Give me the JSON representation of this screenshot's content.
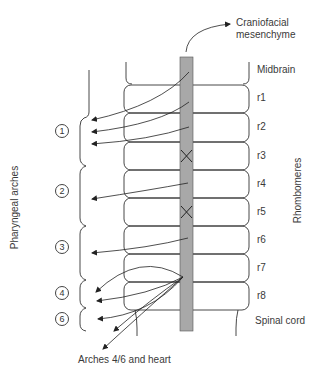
{
  "diagram": {
    "top_label": "Craniofacial\nmesenchyme",
    "top_label_line1": "Craniofacial",
    "top_label_line2": "mesenchyme",
    "bottom_label": "Arches 4/6 and heart",
    "left_axis_label": "Pharyngeal arches",
    "right_axis_label": "Rhombomeres",
    "segments": [
      {
        "label": "Midbrain",
        "y": 70
      },
      {
        "label": "r1",
        "y": 98
      },
      {
        "label": "r2",
        "y": 127
      },
      {
        "label": "r3",
        "y": 156
      },
      {
        "label": "r4",
        "y": 184
      },
      {
        "label": "r5",
        "y": 212
      },
      {
        "label": "r6",
        "y": 240
      },
      {
        "label": "r7",
        "y": 268
      },
      {
        "label": "r8",
        "y": 296
      },
      {
        "label": "Spinal cord",
        "y": 320
      }
    ],
    "arches": [
      {
        "number": "1",
        "y": 130
      },
      {
        "number": "2",
        "y": 190
      },
      {
        "number": "3",
        "y": 246
      },
      {
        "number": "4",
        "y": 292
      },
      {
        "number": "6",
        "y": 319
      }
    ],
    "blocked_rhombomeres": [
      "r3",
      "r5"
    ],
    "colors": {
      "neural_crest_bar": "#a8a8a8",
      "outline": "#333333",
      "text": "#3a3a3a"
    }
  }
}
